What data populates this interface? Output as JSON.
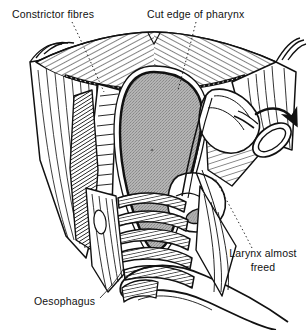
{
  "figure": {
    "kind": "anatomical-surgical-illustration",
    "style": "black-and-white line drawing with hatching and stippled shading",
    "background_color": "#ffffff",
    "ink_color": "#111111",
    "shaded_mass_color": "#a9a9a9",
    "width": 308,
    "height": 330
  },
  "labels": [
    {
      "id": "constrictor-fibres",
      "text": "Constrictor fibres",
      "x": 12,
      "y": 18,
      "anchor": "start",
      "leader": {
        "from": [
          72,
          22
        ],
        "to": [
          104,
          92
        ],
        "style": "dotted"
      }
    },
    {
      "id": "cut-edge-of-pharynx",
      "text": "Cut edge of pharynx",
      "x": 147,
      "y": 18,
      "anchor": "start",
      "leader": {
        "from": [
          196,
          22
        ],
        "to": [
          178,
          90
        ],
        "style": "dotted"
      }
    },
    {
      "id": "larynx-almost-freed",
      "line1": "Larynx almost",
      "line2": "freed",
      "x": 263,
      "y": 257,
      "anchor": "middle",
      "leader": {
        "from": [
          252,
          248
        ],
        "to": [
          215,
          178
        ],
        "style": "dotted"
      }
    },
    {
      "id": "oesophagus",
      "text": "Oesophagus",
      "x": 34,
      "y": 305,
      "anchor": "start",
      "leader": {
        "from": [
          100,
          298
        ],
        "to": [
          124,
          268
        ],
        "style": "solid-thin"
      }
    }
  ],
  "structures": [
    {
      "id": "pharyngeal-arch",
      "name": "cut edge of pharynx arch",
      "shading": "diagonal-hatching"
    },
    {
      "id": "left-constrictor-sheet",
      "name": "left constrictor fibre sheet",
      "shading": "vertical-striations"
    },
    {
      "id": "right-constrictor-sheet",
      "name": "right constrictor fibre sheet",
      "shading": "vertical-striations"
    },
    {
      "id": "central-mass",
      "name": "pharyngeal lumen / tumour mass",
      "shading": "stipple-grey"
    },
    {
      "id": "tracheal-rings",
      "name": "tracheal cartilage rings",
      "shading": "horizontal-hatched-bands"
    },
    {
      "id": "oesophagus-tube",
      "name": "oesophagus",
      "shading": "outline"
    },
    {
      "id": "larynx-body",
      "name": "larynx",
      "shading": "outline"
    },
    {
      "id": "instrument-ring",
      "name": "surgical instrument ring handle",
      "shading": "outline"
    }
  ],
  "annotations": [
    {
      "id": "traction-arrow",
      "name": "curved traction arrow",
      "direction": "down-right",
      "color": "#111111"
    }
  ]
}
